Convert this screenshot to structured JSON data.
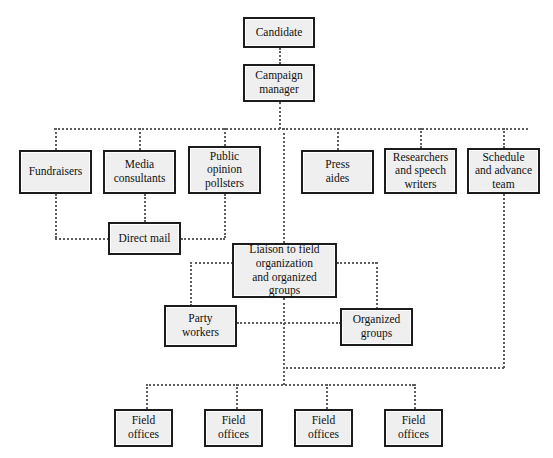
{
  "diagram": {
    "type": "organizational-chart",
    "line_style": "dotted",
    "colors": {
      "box_fill": "#efefef",
      "box_border": "#1c1c1c",
      "line": "#5d5d5d",
      "background": "#ffffff",
      "text": "#111111"
    },
    "nodes": [
      {
        "id": "candidate",
        "label": "Candidate",
        "x": 243,
        "y": 17,
        "w": 72,
        "h": 31
      },
      {
        "id": "campaign-manager",
        "label": "Campaign\nmanager",
        "x": 243,
        "y": 64,
        "w": 72,
        "h": 38
      },
      {
        "id": "fundraisers",
        "label": "Fundraisers",
        "x": 19,
        "y": 150,
        "w": 73,
        "h": 44
      },
      {
        "id": "media-consultants",
        "label": "Media\nconsultants",
        "x": 103,
        "y": 150,
        "w": 73,
        "h": 44
      },
      {
        "id": "public-opinion-pollsters",
        "label": "Public\nopinion\npollsters",
        "x": 188,
        "y": 146,
        "w": 73,
        "h": 48
      },
      {
        "id": "press-aides",
        "label": "Press\naides",
        "x": 301,
        "y": 150,
        "w": 73,
        "h": 44
      },
      {
        "id": "researchers-speech-writers",
        "label": "Researchers\nand speech\nwriters",
        "x": 384,
        "y": 148,
        "w": 73,
        "h": 46
      },
      {
        "id": "schedule-advance-team",
        "label": "Schedule\nand advance\nteam",
        "x": 467,
        "y": 148,
        "w": 73,
        "h": 46
      },
      {
        "id": "direct-mail",
        "label": "Direct mail",
        "x": 108,
        "y": 222,
        "w": 73,
        "h": 33
      },
      {
        "id": "liaison-field-organization",
        "label": "Liaison to field\norganization\nand organized\ngroups",
        "x": 232,
        "y": 243,
        "w": 105,
        "h": 55
      },
      {
        "id": "party-workers",
        "label": "Party\nworkers",
        "x": 164,
        "y": 305,
        "w": 73,
        "h": 42
      },
      {
        "id": "organized-groups",
        "label": "Organized\ngroups",
        "x": 340,
        "y": 308,
        "w": 73,
        "h": 38
      },
      {
        "id": "field-offices-1",
        "label": "Field\noffices",
        "x": 114,
        "y": 409,
        "w": 59,
        "h": 38
      },
      {
        "id": "field-offices-2",
        "label": "Field\noffices",
        "x": 204,
        "y": 409,
        "w": 59,
        "h": 38
      },
      {
        "id": "field-offices-3",
        "label": "Field\noffices",
        "x": 294,
        "y": 409,
        "w": 59,
        "h": 38
      },
      {
        "id": "field-offices-4",
        "label": "Field\noffices",
        "x": 384,
        "y": 409,
        "w": 59,
        "h": 38
      }
    ],
    "connectors": [
      {
        "id": "candidate-to-manager",
        "o": "v",
        "x": 279,
        "y": 48,
        "len": 16
      },
      {
        "id": "manager-to-bus",
        "o": "v",
        "x": 279,
        "y": 102,
        "len": 27
      },
      {
        "id": "top-distribution-bus",
        "o": "h",
        "x": 54,
        "y": 128,
        "len": 474
      },
      {
        "id": "bus-to-fundraisers",
        "o": "v",
        "x": 55,
        "y": 128,
        "len": 22
      },
      {
        "id": "bus-to-media-consultants",
        "o": "v",
        "x": 139,
        "y": 128,
        "len": 22
      },
      {
        "id": "bus-to-pollsters",
        "o": "v",
        "x": 224,
        "y": 128,
        "len": 18
      },
      {
        "id": "bus-to-press-aides",
        "o": "v",
        "x": 337,
        "y": 128,
        "len": 22
      },
      {
        "id": "bus-to-researchers",
        "o": "v",
        "x": 420,
        "y": 128,
        "len": 20
      },
      {
        "id": "bus-to-schedule-team",
        "o": "v",
        "x": 503,
        "y": 128,
        "len": 20
      },
      {
        "id": "fundraisers-drop",
        "o": "v",
        "x": 55,
        "y": 194,
        "len": 44
      },
      {
        "id": "fundraisers-to-direct-mail",
        "o": "h",
        "x": 55,
        "y": 238,
        "len": 54
      },
      {
        "id": "media-to-direct-mail",
        "o": "v",
        "x": 144,
        "y": 194,
        "len": 28
      },
      {
        "id": "pollsters-drop",
        "o": "v",
        "x": 224,
        "y": 194,
        "len": 44
      },
      {
        "id": "direct-mail-to-pollsters",
        "o": "h",
        "x": 181,
        "y": 238,
        "len": 44
      },
      {
        "id": "bus-to-liaison",
        "o": "v",
        "x": 283,
        "y": 128,
        "len": 115
      },
      {
        "id": "liaison-left-stub",
        "o": "h",
        "x": 190,
        "y": 262,
        "len": 43
      },
      {
        "id": "liaison-to-party-workers",
        "o": "v",
        "x": 190,
        "y": 262,
        "len": 44
      },
      {
        "id": "liaison-right-stub",
        "o": "h",
        "x": 337,
        "y": 262,
        "len": 40
      },
      {
        "id": "liaison-to-organized-groups",
        "o": "v",
        "x": 376,
        "y": 262,
        "len": 47
      },
      {
        "id": "liaison-drop",
        "o": "v",
        "x": 283,
        "y": 298,
        "len": 87
      },
      {
        "id": "party-to-organized-bus",
        "o": "h",
        "x": 237,
        "y": 322,
        "len": 104
      },
      {
        "id": "schedule-team-long-drop",
        "o": "v",
        "x": 503,
        "y": 194,
        "len": 174
      },
      {
        "id": "schedule-team-join-bus",
        "o": "h",
        "x": 283,
        "y": 367,
        "len": 221
      },
      {
        "id": "field-offices-bus",
        "o": "h",
        "x": 146,
        "y": 384,
        "len": 268
      },
      {
        "id": "bus-to-field-offices-1",
        "o": "v",
        "x": 146,
        "y": 384,
        "len": 25
      },
      {
        "id": "bus-to-field-offices-2",
        "o": "v",
        "x": 236,
        "y": 384,
        "len": 25
      },
      {
        "id": "bus-to-field-offices-3",
        "o": "v",
        "x": 326,
        "y": 384,
        "len": 25
      },
      {
        "id": "bus-to-field-offices-4",
        "o": "v",
        "x": 414,
        "y": 384,
        "len": 25
      }
    ]
  }
}
